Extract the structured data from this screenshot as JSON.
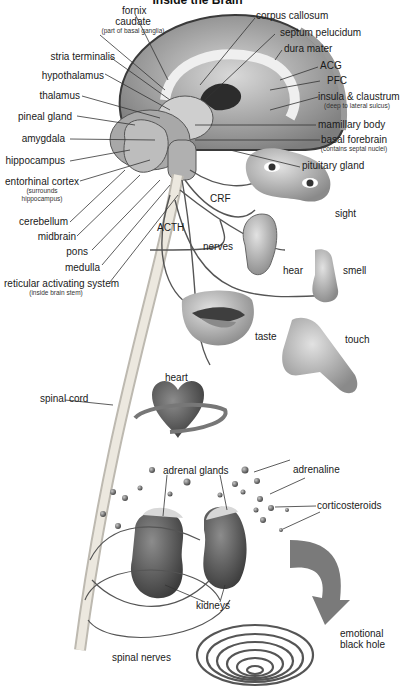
{
  "title": "Inside the Brain",
  "colors": {
    "background": "#ffffff",
    "ink": "#1a1a1a",
    "organ_fill": "#6e6e6e",
    "spinal_cord": "#e6e1d6",
    "arrow": "#7a7a7a"
  },
  "brain_labels_left": {
    "caudate": "caudate",
    "caudate_note": "(part of basal ganglia)",
    "stria_terminalis": "stria terminalis",
    "hypothalamus": "hypothalamus",
    "thalamus": "thalamus",
    "pineal_gland": "pineal gland",
    "amygdala": "amygdala",
    "hippocampus": "hippocampus",
    "entorhinal_cortex": "entorhinal cortex",
    "entorhinal_note_1": "(surrounds",
    "entorhinal_note_2": "hippocampus)",
    "cerebellum": "cerebellum",
    "midbrain": "midbrain",
    "pons": "pons",
    "medulla": "medulla",
    "reticular": "reticular activating system",
    "reticular_note": "(inside brain stem)"
  },
  "brain_labels_top": {
    "fornix": "fornix"
  },
  "brain_labels_right": {
    "corpus_callosum": "corpus callosum",
    "septum_pelucidum": "septum pelucidum",
    "dura_mater": "dura mater",
    "acg": "ACG",
    "pfc": "PFC",
    "insula": "insula & claustrum",
    "insula_note": "(deep to lateral sulcus)",
    "mamillary_body": "mamillary body",
    "basal_forebrain": "basal forebrain",
    "basal_forebrain_note": "(contains septal nuclei)",
    "pituitary_gland": "pituitary gland"
  },
  "hormones": {
    "crf": "CRF",
    "acth": "ACTH"
  },
  "senses": {
    "nerves": "nerves",
    "sight": "sight",
    "hear": "hear",
    "smell": "smell",
    "taste": "taste",
    "touch": "touch"
  },
  "body": {
    "heart": "heart",
    "spinal_cord": "spinal cord",
    "adrenal_glands": "adrenal glands",
    "adrenaline": "adrenaline",
    "corticosteroids": "corticosteroids",
    "kidneys": "kidneys",
    "spinal_nerves": "spinal nerves",
    "emotional_1": "emotional",
    "emotional_2": "black hole"
  }
}
